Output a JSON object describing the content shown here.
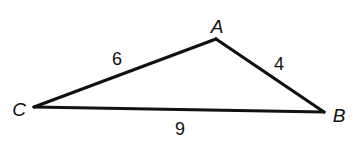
{
  "diagram": {
    "type": "triangle",
    "vertices": {
      "A": {
        "label": "A",
        "x": 216,
        "y": 39
      },
      "B": {
        "label": "B",
        "x": 324,
        "y": 112
      },
      "C": {
        "label": "C",
        "x": 34,
        "y": 107
      }
    },
    "sides": {
      "CA": {
        "from": "C",
        "to": "A",
        "length_label": "6"
      },
      "AB": {
        "from": "A",
        "to": "B",
        "length_label": "4"
      },
      "CB": {
        "from": "C",
        "to": "B",
        "length_label": "9"
      }
    },
    "colors": {
      "stroke": "#111111",
      "background": "#ffffff"
    }
  }
}
